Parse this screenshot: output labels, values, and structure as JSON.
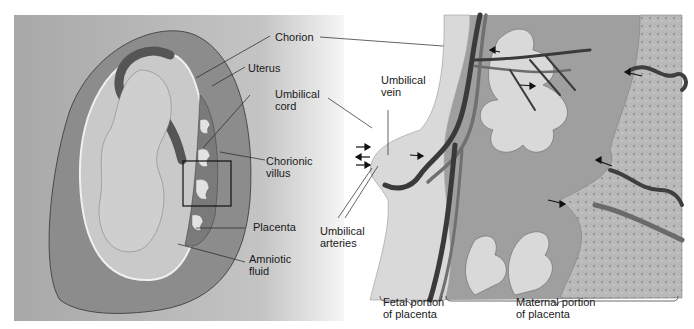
{
  "figure": {
    "left_panel": {
      "labels": {
        "chorion": "Chorion",
        "uterus": "Uterus",
        "umbilical_cord": [
          "Umbilical",
          "cord"
        ],
        "chorionic_villus": [
          "Chorionic",
          "villus"
        ],
        "placenta": "Placenta",
        "amniotic_fluid": [
          "Amniotic",
          "fluid"
        ]
      }
    },
    "right_panel": {
      "labels": {
        "umbilical_vein": [
          "Umbilical",
          "vein"
        ],
        "umbilical_arteries": [
          "Umbilical",
          "arteries"
        ],
        "fetal_portion": [
          "Fetal portion",
          "of placenta"
        ],
        "maternal_portion": [
          "Maternal portion",
          "of placenta"
        ]
      }
    },
    "colors": {
      "left_bg": "#a9a9a9",
      "uterus_wall": "#8a8a8a",
      "amniotic_sac": "#c8c8c8",
      "vessel_dark": "#3c3c3c",
      "vessel_mid": "#707070",
      "maternal_tissue": "#b8b8b8",
      "villus_fill": "#d8d8d8"
    }
  }
}
